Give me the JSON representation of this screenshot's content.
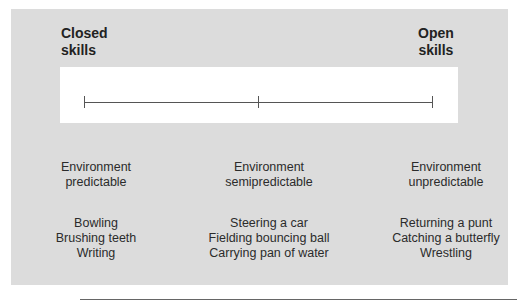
{
  "diagram": {
    "type": "continuum",
    "poles": {
      "left": {
        "line1": "Closed",
        "line2": "skills"
      },
      "right": {
        "line1": "Open",
        "line2": "skills"
      }
    },
    "continuum_ticks": 3,
    "columns": [
      {
        "environment_line1": "Environment",
        "environment_line2": "predictable",
        "examples": [
          "Bowling",
          "Brushing teeth",
          "Writing"
        ]
      },
      {
        "environment_line1": "Environment",
        "environment_line2": "semipredictable",
        "examples": [
          "Steering a car",
          "Fielding bouncing ball",
          "Carrying pan of water"
        ]
      },
      {
        "environment_line1": "Environment",
        "environment_line2": "unpredictable",
        "examples": [
          "Returning a punt",
          "Catching a butterfly",
          "Wrestling"
        ]
      }
    ],
    "colors": {
      "panel": "#dcdcdc",
      "strip": "#ffffff",
      "line": "#555555",
      "text": "#2b2b2b"
    }
  }
}
